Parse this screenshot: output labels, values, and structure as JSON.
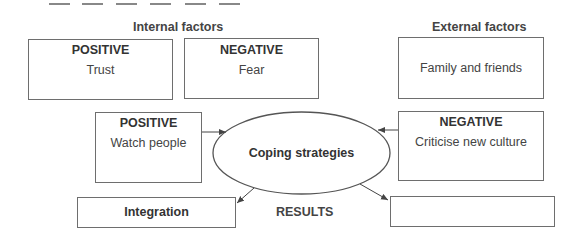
{
  "dashes": {
    "count": 6
  },
  "internal": {
    "title": "Internal factors",
    "positive": {
      "header": "POSITIVE",
      "text": "Trust"
    },
    "negative": {
      "header": "NEGATIVE",
      "text": "Fear"
    }
  },
  "external": {
    "title": "External factors",
    "box": {
      "text": "Family and friends"
    }
  },
  "strategies": {
    "positive": {
      "header": "POSITIVE",
      "text": "Watch people"
    },
    "negative": {
      "header": "NEGATIVE",
      "text": "Criticise new culture"
    },
    "center": "Coping strategies"
  },
  "results": {
    "label": "RESULTS",
    "left": "Integration",
    "right": ""
  }
}
